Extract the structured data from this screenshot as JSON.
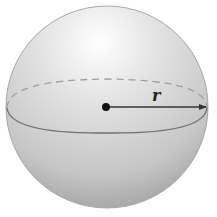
{
  "diagram": {
    "radius_label": "r",
    "colors": {
      "background": "#ffffff",
      "sphere_light": "#ffffff",
      "sphere_mid": "#d8d8d8",
      "sphere_dark": "#9a9a9a",
      "equator_front": "#6e6e6e",
      "equator_back": "#9e9e9e",
      "center_dot": "#111111",
      "radius_arrow": "#333333"
    }
  }
}
